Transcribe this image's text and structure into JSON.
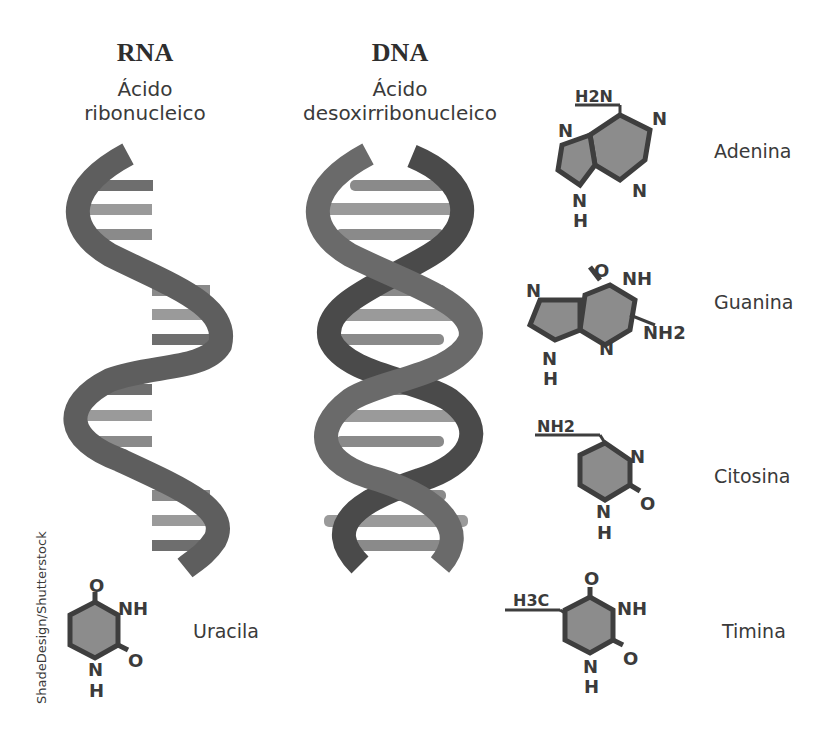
{
  "rna": {
    "title": "RNA",
    "subtitle_line1": "Ácido",
    "subtitle_line2": "ribonucleico"
  },
  "dna": {
    "title": "DNA",
    "subtitle_line1": "Ácido",
    "subtitle_line2": "desoxirribonucleico"
  },
  "bases": {
    "adenina": {
      "label": "Adenina",
      "atoms": [
        "H2N",
        "N",
        "N",
        "N",
        "N",
        "H"
      ]
    },
    "guanina": {
      "label": "Guanina",
      "atoms": [
        "O",
        "NH",
        "N",
        "NH2",
        "N",
        "N",
        "H"
      ]
    },
    "citosina": {
      "label": "Citosina",
      "atoms": [
        "NH2",
        "N",
        "O",
        "N",
        "H"
      ]
    },
    "timina": {
      "label": "Timina",
      "atoms": [
        "H3C",
        "O",
        "NH",
        "O",
        "N",
        "H"
      ]
    },
    "uracila": {
      "label": "Uracila",
      "atoms": [
        "O",
        "NH",
        "O",
        "N",
        "H"
      ]
    }
  },
  "credit": "ShadeDesign/Shutterstock",
  "colors": {
    "strand_front": "#6a6a6a",
    "strand_back": "#4a4a4a",
    "rung_light": "#9a9a9a",
    "rung_dark": "#6e6e6e",
    "ring_fill": "#8c8c8c",
    "ring_stroke": "#3e3e3e",
    "text": "#333333"
  }
}
